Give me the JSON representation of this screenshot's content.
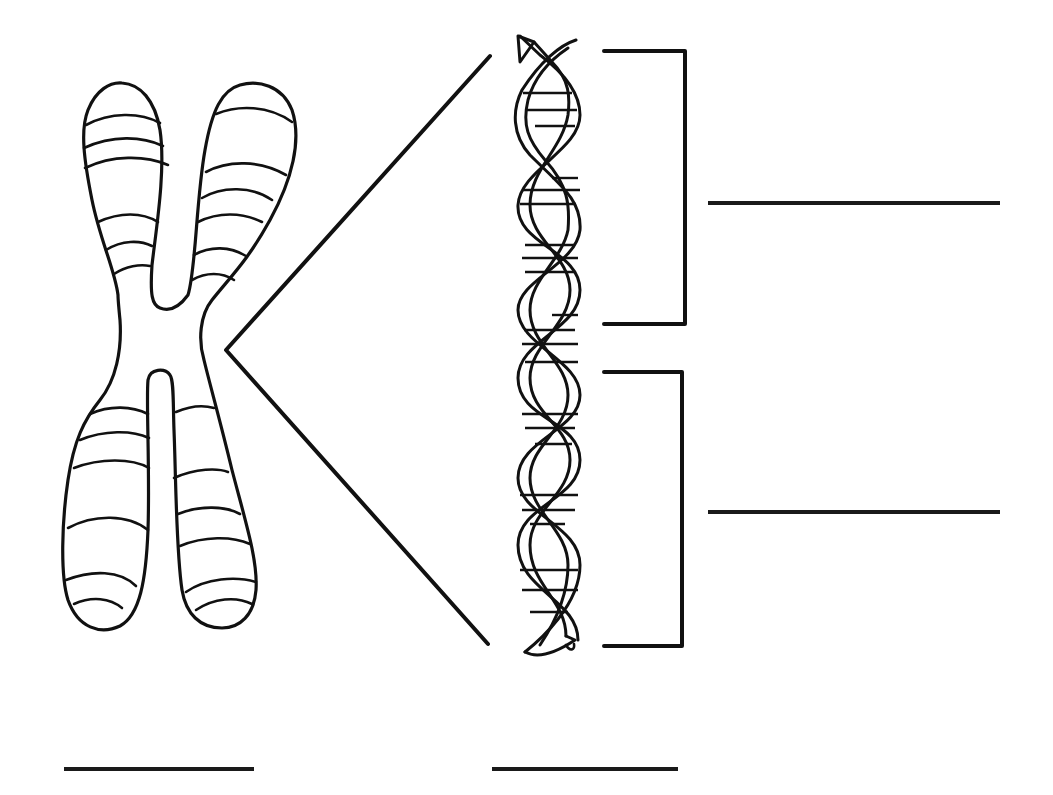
{
  "diagram": {
    "title": "",
    "colors": {
      "background": "#ffffff",
      "ink": "#111111"
    },
    "elements": {
      "chromosome": {
        "kind": "x-shaped banded chromosome"
      },
      "zoom_callout": {
        "kind": "two lines converging from chromosome centromere to helix"
      },
      "double_helix": {
        "kind": "DNA double helix with base-pair rungs"
      },
      "brackets": [
        {
          "id": "upper-bracket",
          "spans": "upper helix segment"
        },
        {
          "id": "lower-bracket",
          "spans": "lower helix segment"
        }
      ]
    },
    "label_blanks": [
      {
        "id": "upper-bracket-label",
        "text": ""
      },
      {
        "id": "lower-bracket-label",
        "text": ""
      },
      {
        "id": "chromosome-label",
        "text": ""
      },
      {
        "id": "helix-label",
        "text": ""
      }
    ]
  }
}
